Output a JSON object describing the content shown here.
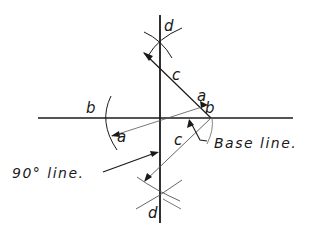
{
  "diagram": {
    "colors": {
      "ink": "#1a1a1a",
      "background": "#ffffff",
      "thin": "#555555"
    },
    "labels": {
      "d_top": "d",
      "d_bottom": "d",
      "c_upper": "c",
      "c_lower": "c",
      "a_right": "a",
      "a_left": "a",
      "b_left": "b",
      "b_right": "b",
      "base_line": "Base line.",
      "ninety_line": "90° line."
    },
    "points": {
      "intersection": [
        160,
        118
      ],
      "b_point": [
        211,
        118
      ],
      "d_upper": [
        160,
        39
      ],
      "d_lower": [
        160,
        198
      ]
    }
  }
}
